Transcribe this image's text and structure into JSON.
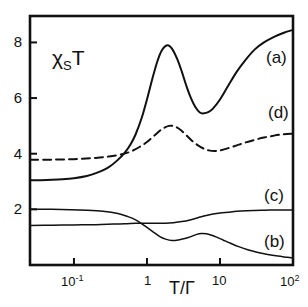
{
  "figure": {
    "background": "#ffffff",
    "line_color": "#111111"
  },
  "chart_data": {
    "type": "line",
    "title": "",
    "subtitle": "",
    "xlabel": "T/Γ",
    "ylabel": "χ_S T",
    "ylabel_parts": {
      "chi": "χ",
      "sub": "S",
      "tail": "T"
    },
    "xscale": "log",
    "yscale": "linear",
    "xlim": [
      0.025,
      100
    ],
    "ylim": [
      0.0,
      8.95
    ],
    "grid": false,
    "legend_position": "inline-right-annotations",
    "xticks": [
      0.1,
      1,
      10,
      100
    ],
    "xtick_labels": [
      "10⁻¹",
      "1",
      "10",
      "10²"
    ],
    "xtick_label_mantissa": [
      "10",
      "1",
      "10",
      "10"
    ],
    "xtick_label_exponent": [
      "-1",
      "",
      "",
      "2"
    ],
    "yticks": [
      2,
      4,
      6,
      8
    ],
    "ytick_labels": [
      "2",
      "4",
      "6",
      "8"
    ],
    "annotations": [
      {
        "text": "(a)",
        "x_px": 266,
        "y_px": 48
      },
      {
        "text": "(d)",
        "x_px": 268,
        "y_px": 103
      },
      {
        "text": "(c)",
        "x_px": 264,
        "y_px": 186
      },
      {
        "text": "(b)",
        "x_px": 264,
        "y_px": 232
      }
    ],
    "series": [
      {
        "name": "(a)",
        "style": "solid",
        "color": "#111111",
        "width": 2.0,
        "x": [
          0.025,
          0.035,
          0.05,
          0.07,
          0.1,
          0.15,
          0.2,
          0.3,
          0.4,
          0.5,
          0.6,
          0.7,
          0.85,
          1.0,
          1.2,
          1.4,
          1.6,
          1.9,
          2.2,
          2.6,
          3.0,
          3.5,
          4.0,
          4.6,
          5.3,
          6.0,
          7.0,
          8.0,
          10.0,
          13.0,
          17.0,
          22.0,
          30.0,
          40.0,
          55.0,
          75.0,
          100.0
        ],
        "y": [
          3.05,
          3.05,
          3.06,
          3.08,
          3.12,
          3.2,
          3.3,
          3.52,
          3.78,
          4.05,
          4.35,
          4.7,
          5.3,
          5.95,
          6.75,
          7.35,
          7.72,
          7.9,
          7.78,
          7.4,
          6.95,
          6.4,
          6.0,
          5.68,
          5.48,
          5.45,
          5.5,
          5.62,
          5.95,
          6.45,
          6.95,
          7.35,
          7.75,
          8.0,
          8.2,
          8.35,
          8.45
        ]
      },
      {
        "name": "(d)",
        "style": "dashed",
        "color": "#111111",
        "width": 2.0,
        "dash_pattern": "8,5",
        "x": [
          0.025,
          0.04,
          0.06,
          0.09,
          0.13,
          0.2,
          0.3,
          0.45,
          0.6,
          0.8,
          1.0,
          1.3,
          1.6,
          2.0,
          2.4,
          2.9,
          3.5,
          4.2,
          5.0,
          6.0,
          7.0,
          8.5,
          10.0,
          13.0,
          17.0,
          22.0,
          30.0,
          40.0,
          55.0,
          75.0,
          100.0
        ],
        "y": [
          3.78,
          3.78,
          3.79,
          3.8,
          3.82,
          3.85,
          3.9,
          3.98,
          4.08,
          4.25,
          4.42,
          4.68,
          4.88,
          5.0,
          4.98,
          4.85,
          4.65,
          4.45,
          4.3,
          4.18,
          4.12,
          4.1,
          4.12,
          4.2,
          4.3,
          4.4,
          4.5,
          4.58,
          4.65,
          4.7,
          4.72
        ]
      },
      {
        "name": "(c)",
        "style": "solid",
        "color": "#111111",
        "width": 1.5,
        "x": [
          0.025,
          0.05,
          0.1,
          0.2,
          0.35,
          0.5,
          0.7,
          0.9,
          1.1,
          1.4,
          1.8,
          2.3,
          3.0,
          4.0,
          5.0,
          6.5,
          8.0,
          10.0,
          13.0,
          17.0,
          23.0,
          30.0,
          42.0,
          58.0,
          78.0,
          100.0
        ],
        "y": [
          1.42,
          1.43,
          1.44,
          1.45,
          1.47,
          1.48,
          1.5,
          1.5,
          1.5,
          1.5,
          1.5,
          1.52,
          1.56,
          1.63,
          1.7,
          1.78,
          1.83,
          1.87,
          1.9,
          1.93,
          1.95,
          1.96,
          1.97,
          1.98,
          1.98,
          1.98
        ]
      },
      {
        "name": "(b)",
        "style": "solid",
        "color": "#111111",
        "width": 1.5,
        "x": [
          0.025,
          0.05,
          0.09,
          0.15,
          0.25,
          0.4,
          0.55,
          0.7,
          0.85,
          1.0,
          1.2,
          1.5,
          1.8,
          2.2,
          2.7,
          3.3,
          4.0,
          4.8,
          5.6,
          6.5,
          7.5,
          9.0,
          11.0,
          14.0,
          18.0,
          24.0,
          32.0,
          45.0,
          62.0,
          82.0,
          100.0
        ],
        "y": [
          2.0,
          2.0,
          1.99,
          1.97,
          1.93,
          1.85,
          1.74,
          1.62,
          1.48,
          1.35,
          1.2,
          1.02,
          0.93,
          0.88,
          0.9,
          0.95,
          1.02,
          1.1,
          1.13,
          1.12,
          1.08,
          1.0,
          0.9,
          0.78,
          0.66,
          0.55,
          0.46,
          0.38,
          0.32,
          0.28,
          0.25
        ]
      }
    ]
  },
  "axes_geometry": {
    "left_px": 30,
    "right_px": 293,
    "top_px": 16,
    "bottom_px": 265
  }
}
